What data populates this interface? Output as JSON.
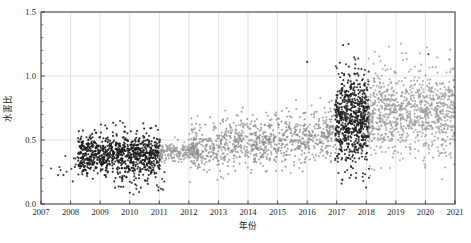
{
  "chart_data": {
    "type": "scatter",
    "title": "",
    "xlabel": "年份",
    "ylabel": "水害比",
    "xlim": [
      2007,
      2021
    ],
    "ylim": [
      0.0,
      1.5
    ],
    "grid": true,
    "legend": "none",
    "x_ticks": [
      "2007",
      "2008",
      "2009",
      "2010",
      "2011",
      "2012",
      "2013",
      "2014",
      "2015",
      "2016",
      "2017",
      "2018",
      "2019",
      "2020",
      "2021"
    ],
    "x_tick_values": [
      2007,
      2008,
      2009,
      2010,
      2011,
      2012,
      2013,
      2014,
      2015,
      2016,
      2017,
      2018,
      2019,
      2020,
      2021
    ],
    "y_ticks": [
      "0.0",
      "0.5",
      "1.0",
      "1.5"
    ],
    "y_tick_values": [
      0.0,
      0.5,
      1.0,
      1.5
    ],
    "y_minor_step": 0.1,
    "marker": "circle",
    "marker_size_px": 1.6,
    "series": [
      {
        "name": "dark-cluster-early",
        "color": "#1c1c1c",
        "note": "dense dark cloud 2008.3-2011.0 centred near 0.38",
        "n": 900,
        "x_range": [
          2008.25,
          2011.02
        ],
        "y_center": 0.385,
        "y_spread": 0.075
      },
      {
        "name": "grey-band-2011",
        "color": "#9a9a9a",
        "note": "grey horizontal band 2011.0-2012.3 at ~0.40",
        "n": 220,
        "x_range": [
          2010.98,
          2012.35
        ],
        "y_center": 0.405,
        "y_spread": 0.035
      },
      {
        "name": "grey-midrange",
        "color": "#8d8d8d",
        "note": "diffuse grey cloud rising 2012-2017",
        "n": 900,
        "x_range": [
          2012.0,
          2017.0
        ],
        "y_center_start": 0.43,
        "y_center_end": 0.55,
        "y_spread": 0.1
      },
      {
        "name": "dark-cluster-2017",
        "color": "#202020",
        "note": "dense dark cloud 2016.95-2018.1, wide vertical spread 0.3-1.05",
        "n": 700,
        "x_range": [
          2016.95,
          2018.1
        ],
        "y_center": 0.66,
        "y_spread": 0.175
      },
      {
        "name": "grey-late",
        "color": "#9b9b9b",
        "note": "diffuse grey cloud 2018-2021 centred near 0.72",
        "n": 950,
        "x_range": [
          2018.05,
          2021.0
        ],
        "y_center": 0.715,
        "y_spread": 0.155
      },
      {
        "name": "sparse-2007",
        "color": "#2a2a2a",
        "note": "few isolated points 2007.3-2008.3 near 0.28",
        "n": 14,
        "x_range": [
          2007.3,
          2008.3
        ],
        "y_center": 0.29,
        "y_spread": 0.05
      },
      {
        "name": "low-outliers-2010",
        "color": "#222222",
        "note": "scattered low points 2009.6-2011.2 around 0.13-0.22",
        "n": 28,
        "x_range": [
          2009.6,
          2011.2
        ],
        "y_center": 0.175,
        "y_spread": 0.055
      }
    ],
    "annotations": [
      {
        "label": "high outlier",
        "x": 2017.4,
        "y": 1.25
      },
      {
        "label": "high outlier",
        "x": 2016.0,
        "y": 1.11
      },
      {
        "label": "high outlier",
        "x": 2020.1,
        "y": 1.17
      }
    ]
  },
  "axes": {
    "x_axis_name": "年份",
    "y_axis_name": "水害比"
  }
}
